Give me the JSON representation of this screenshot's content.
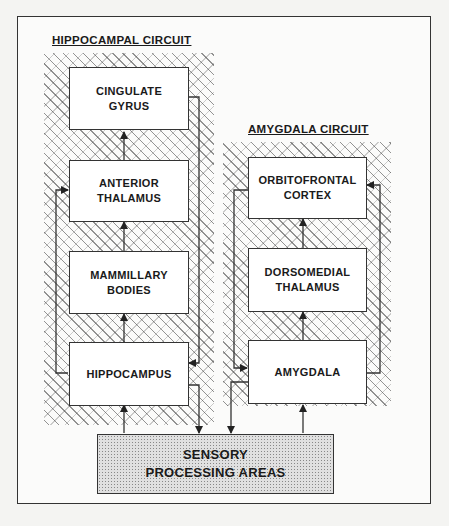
{
  "diagram": {
    "circuits": [
      {
        "title": "HIPPOCAMPAL CIRCUIT",
        "nodes": [
          {
            "id": "cingulate",
            "lines": [
              "CINGULATE",
              "GYRUS"
            ]
          },
          {
            "id": "anterior_thalamus",
            "lines": [
              "ANTERIOR",
              "THALAMUS"
            ]
          },
          {
            "id": "mammillary",
            "lines": [
              "MAMMILLARY",
              "BODIES"
            ]
          },
          {
            "id": "hippocampus",
            "lines": [
              "HIPPOCAMPUS"
            ]
          }
        ]
      },
      {
        "title": "AMYGDALA CIRCUIT",
        "nodes": [
          {
            "id": "orbitofrontal",
            "lines": [
              "ORBITOFRONTAL",
              "CORTEX"
            ]
          },
          {
            "id": "dorsomedial",
            "lines": [
              "DORSOMEDIAL",
              "THALAMUS"
            ]
          },
          {
            "id": "amygdala",
            "lines": [
              "AMYGDALA"
            ]
          }
        ]
      }
    ],
    "sensory": {
      "lines": [
        "SENSORY",
        "PROCESSING AREAS"
      ]
    },
    "edges": [
      [
        "hippocampus",
        "mammillary"
      ],
      [
        "mammillary",
        "anterior_thalamus"
      ],
      [
        "anterior_thalamus",
        "cingulate"
      ],
      [
        "cingulate",
        "hippocampus"
      ],
      [
        "hippocampus",
        "anterior_thalamus"
      ],
      [
        "amygdala",
        "dorsomedial"
      ],
      [
        "dorsomedial",
        "orbitofrontal"
      ],
      [
        "amygdala",
        "orbitofrontal"
      ],
      [
        "orbitofrontal",
        "amygdala"
      ],
      [
        "sensory",
        "hippocampus"
      ],
      [
        "hippocampus",
        "sensory"
      ],
      [
        "amygdala",
        "sensory"
      ],
      [
        "sensory",
        "amygdala"
      ]
    ]
  }
}
